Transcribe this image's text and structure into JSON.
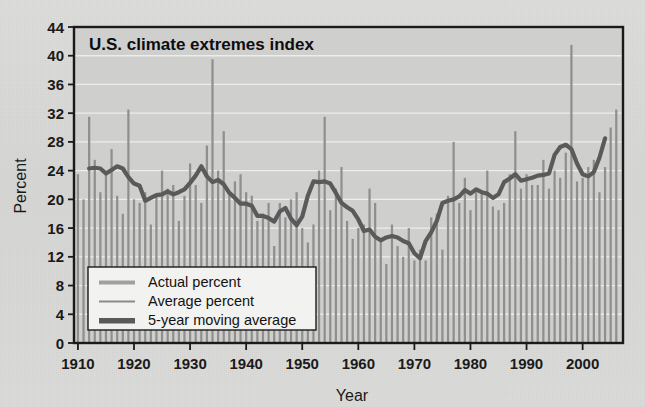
{
  "figure": {
    "background_color": "#d8d8d6",
    "plot_background_color": "#cfcfcd",
    "frame_color": "#1a1a1a"
  },
  "chart_data": {
    "type": "bar",
    "title": "U.S. climate extremes index",
    "xlabel": "Year",
    "ylabel": "Percent",
    "xlim": [
      1909.3,
      2007.2
    ],
    "ylim": [
      0,
      44
    ],
    "yticks": [
      0,
      4,
      8,
      12,
      16,
      20,
      24,
      28,
      32,
      36,
      40,
      44
    ],
    "xticks": [
      1910,
      1920,
      1930,
      1940,
      1950,
      1960,
      1970,
      1980,
      1990,
      2000
    ],
    "grid": "horizontal",
    "legend_position": "lower-left",
    "bar_color": "#8f8f8f",
    "line_color": "#5a5a5a",
    "legend": [
      {
        "label": "Actual percent",
        "style": "bar-swatch",
        "color": "#9a9a9a"
      },
      {
        "label": "Average percent",
        "style": "thin-line",
        "color": "#8a8a8a"
      },
      {
        "label": "5-year moving average",
        "style": "thick-line",
        "color": "#5a5a5a"
      }
    ],
    "categories": [
      1910,
      1911,
      1912,
      1913,
      1914,
      1915,
      1916,
      1917,
      1918,
      1919,
      1920,
      1921,
      1922,
      1923,
      1924,
      1925,
      1926,
      1927,
      1928,
      1929,
      1930,
      1931,
      1932,
      1933,
      1934,
      1935,
      1936,
      1937,
      1938,
      1939,
      1940,
      1941,
      1942,
      1943,
      1944,
      1945,
      1946,
      1947,
      1948,
      1949,
      1950,
      1951,
      1952,
      1953,
      1954,
      1955,
      1956,
      1957,
      1958,
      1959,
      1960,
      1961,
      1962,
      1963,
      1964,
      1965,
      1966,
      1967,
      1968,
      1969,
      1970,
      1971,
      1972,
      1973,
      1974,
      1975,
      1976,
      1977,
      1978,
      1979,
      1980,
      1981,
      1982,
      1983,
      1984,
      1985,
      1986,
      1987,
      1988,
      1989,
      1990,
      1991,
      1992,
      1993,
      1994,
      1995,
      1996,
      1997,
      1998,
      1999,
      2000,
      2001,
      2002,
      2003,
      2004,
      2005,
      2006
    ],
    "values": [
      23.5,
      20.0,
      31.5,
      25.5,
      21.0,
      24.0,
      27.0,
      20.5,
      18.0,
      32.5,
      20.0,
      19.5,
      21.0,
      16.5,
      20.5,
      24.0,
      21.5,
      22.0,
      17.0,
      20.5,
      25.0,
      22.0,
      19.5,
      27.5,
      39.5,
      24.0,
      29.5,
      21.0,
      22.5,
      23.5,
      21.0,
      20.5,
      17.0,
      18.0,
      19.5,
      13.5,
      19.5,
      17.5,
      20.0,
      21.0,
      16.0,
      14.0,
      16.5,
      24.0,
      31.5,
      18.5,
      21.5,
      24.5,
      17.0,
      14.5,
      16.0,
      16.5,
      21.5,
      19.5,
      14.5,
      11.0,
      16.5,
      13.5,
      12.0,
      16.0,
      11.5,
      13.0,
      11.5,
      17.5,
      18.0,
      13.0,
      20.5,
      28.0,
      19.5,
      23.0,
      18.5,
      21.5,
      21.0,
      24.0,
      19.0,
      18.5,
      19.5,
      23.5,
      29.5,
      21.5,
      23.5,
      22.0,
      22.0,
      25.5,
      21.5,
      24.0,
      23.0,
      26.5,
      41.5,
      22.5,
      23.0,
      24.5,
      25.5,
      21.0,
      24.5,
      30.0,
      32.5
    ],
    "series": [
      {
        "name": "5-year moving average",
        "type": "line",
        "x": [
          1912,
          1913,
          1914,
          1915,
          1916,
          1917,
          1918,
          1919,
          1920,
          1921,
          1922,
          1923,
          1924,
          1925,
          1926,
          1927,
          1928,
          1929,
          1930,
          1931,
          1932,
          1933,
          1934,
          1935,
          1936,
          1937,
          1938,
          1939,
          1940,
          1941,
          1942,
          1943,
          1944,
          1945,
          1946,
          1947,
          1948,
          1949,
          1950,
          1951,
          1952,
          1953,
          1954,
          1955,
          1956,
          1957,
          1958,
          1959,
          1960,
          1961,
          1962,
          1963,
          1964,
          1965,
          1966,
          1967,
          1968,
          1969,
          1970,
          1971,
          1972,
          1973,
          1974,
          1975,
          1976,
          1977,
          1978,
          1979,
          1980,
          1981,
          1982,
          1983,
          1984,
          1985,
          1986,
          1987,
          1988,
          1989,
          1990,
          1991,
          1992,
          1993,
          1994,
          1995,
          1996,
          1997,
          1998,
          1999,
          2000,
          2001,
          2002,
          2003,
          2004
        ],
        "values": [
          24.3,
          24.4,
          24.3,
          23.6,
          24.1,
          24.6,
          24.3,
          23.1,
          22.2,
          21.9,
          19.8,
          20.2,
          20.6,
          20.7,
          21.1,
          20.7,
          21.0,
          21.4,
          22.3,
          23.3,
          24.6,
          23.2,
          22.4,
          22.7,
          22.1,
          20.9,
          20.2,
          19.4,
          19.4,
          19.1,
          17.7,
          17.7,
          17.4,
          16.9,
          18.3,
          18.8,
          17.3,
          16.4,
          17.6,
          20.5,
          22.5,
          22.4,
          22.5,
          22.2,
          20.9,
          19.5,
          18.9,
          18.4,
          17.2,
          15.6,
          15.8,
          14.8,
          14.3,
          14.7,
          14.9,
          14.7,
          14.2,
          13.9,
          12.5,
          11.8,
          14.2,
          15.4,
          17.0,
          19.5,
          19.8,
          20.0,
          20.4,
          21.3,
          20.8,
          21.4,
          21.0,
          20.8,
          20.2,
          20.7,
          22.4,
          22.9,
          23.5,
          22.6,
          22.8,
          23.0,
          23.3,
          23.4,
          23.6,
          26.2,
          27.3,
          27.6,
          27.0,
          25.0,
          23.5,
          23.2,
          23.8,
          25.8,
          28.5
        ]
      }
    ]
  }
}
